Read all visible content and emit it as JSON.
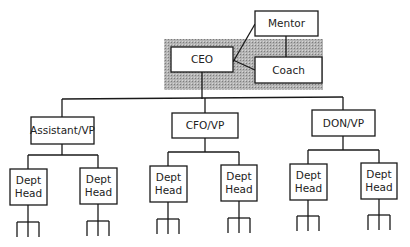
{
  "diagram": {
    "type": "org-chart",
    "colors": {
      "line": "#1a1a1a",
      "box_fill": "#ffffff",
      "shade": "#a8a8a8",
      "text": "#222222"
    },
    "shaded_region": {
      "x": 164,
      "y": 39,
      "w": 159,
      "h": 51
    },
    "nodes": [
      {
        "id": "mentor",
        "label": [
          "Mentor"
        ],
        "x": 255,
        "y": 11,
        "w": 63,
        "h": 25
      },
      {
        "id": "ceo",
        "label": [
          "CEO"
        ],
        "x": 171,
        "y": 47,
        "w": 62,
        "h": 25
      },
      {
        "id": "coach",
        "label": [
          "Coach"
        ],
        "x": 255,
        "y": 57,
        "w": 67,
        "h": 26
      },
      {
        "id": "assistant-vp",
        "label": [
          "Assistant/VP"
        ],
        "x": 31,
        "y": 117,
        "w": 63,
        "h": 27
      },
      {
        "id": "cfo-vp",
        "label": [
          "CFO/VP"
        ],
        "x": 172,
        "y": 113,
        "w": 66,
        "h": 25
      },
      {
        "id": "don-vp",
        "label": [
          "DON/VP"
        ],
        "x": 312,
        "y": 110,
        "w": 63,
        "h": 26
      },
      {
        "id": "dept-head-1",
        "label": [
          "Dept",
          "Head"
        ],
        "x": 10,
        "y": 169,
        "w": 37,
        "h": 36
      },
      {
        "id": "dept-head-2",
        "label": [
          "Dept",
          "Head"
        ],
        "x": 80,
        "y": 168,
        "w": 37,
        "h": 36
      },
      {
        "id": "dept-head-3",
        "label": [
          "Dept",
          "Head"
        ],
        "x": 150,
        "y": 166,
        "w": 37,
        "h": 36
      },
      {
        "id": "dept-head-4",
        "label": [
          "Dept",
          "Head"
        ],
        "x": 221,
        "y": 165,
        "w": 36,
        "h": 36
      },
      {
        "id": "dept-head-5",
        "label": [
          "Dept",
          "Head"
        ],
        "x": 290,
        "y": 164,
        "w": 37,
        "h": 36
      },
      {
        "id": "dept-head-6",
        "label": [
          "Dept",
          "Head"
        ],
        "x": 361,
        "y": 163,
        "w": 36,
        "h": 36
      }
    ],
    "edges": [
      {
        "from": "ceo",
        "to": "mentor",
        "points": [
          [
            233,
            62
          ],
          [
            255,
            24
          ]
        ]
      },
      {
        "from": "ceo",
        "to": "coach",
        "points": [
          [
            233,
            60
          ],
          [
            255,
            70
          ]
        ]
      },
      {
        "from": "mentor",
        "to": "coach",
        "points": [
          [
            286,
            36
          ],
          [
            286,
            57
          ]
        ]
      },
      {
        "from": "ceo",
        "to": "trunk",
        "points": [
          [
            202,
            72
          ],
          [
            202,
            99
          ]
        ]
      },
      {
        "from": "trunk",
        "to": "vps",
        "points": [
          [
            62,
            99
          ],
          [
            343,
            97
          ]
        ]
      },
      {
        "from": "trunk",
        "to": "assistant-vp",
        "points": [
          [
            62,
            99
          ],
          [
            62,
            117
          ]
        ]
      },
      {
        "from": "trunk",
        "to": "cfo-vp",
        "points": [
          [
            205,
            98
          ],
          [
            205,
            113
          ]
        ]
      },
      {
        "from": "trunk",
        "to": "don-vp",
        "points": [
          [
            343,
            97
          ],
          [
            343,
            110
          ]
        ]
      },
      {
        "from": "assistant-vp",
        "to": "bar1",
        "points": [
          [
            62,
            144
          ],
          [
            62,
            155
          ]
        ]
      },
      {
        "from": "bar1",
        "to": "dept-heads",
        "points": [
          [
            28,
            155
          ],
          [
            98,
            155
          ]
        ]
      },
      {
        "from": "bar1",
        "to": "dept-head-1",
        "points": [
          [
            28,
            155
          ],
          [
            28,
            169
          ]
        ]
      },
      {
        "from": "bar1",
        "to": "dept-head-2",
        "points": [
          [
            98,
            155
          ],
          [
            98,
            168
          ]
        ]
      },
      {
        "from": "cfo-vp",
        "to": "bar2",
        "points": [
          [
            205,
            138
          ],
          [
            205,
            152
          ]
        ]
      },
      {
        "from": "bar2",
        "to": "dept-heads",
        "points": [
          [
            168,
            152
          ],
          [
            239,
            152
          ]
        ]
      },
      {
        "from": "bar2",
        "to": "dept-head-3",
        "points": [
          [
            168,
            152
          ],
          [
            168,
            166
          ]
        ]
      },
      {
        "from": "bar2",
        "to": "dept-head-4",
        "points": [
          [
            239,
            152
          ],
          [
            239,
            165
          ]
        ]
      },
      {
        "from": "don-vp",
        "to": "bar3",
        "points": [
          [
            343,
            136
          ],
          [
            343,
            150
          ]
        ]
      },
      {
        "from": "bar3",
        "to": "dept-heads",
        "points": [
          [
            308,
            150
          ],
          [
            379,
            150
          ]
        ]
      },
      {
        "from": "bar3",
        "to": "dept-head-5",
        "points": [
          [
            308,
            150
          ],
          [
            308,
            164
          ]
        ]
      },
      {
        "from": "bar3",
        "to": "dept-head-6",
        "points": [
          [
            379,
            150
          ],
          [
            379,
            163
          ]
        ]
      }
    ],
    "forks": [
      {
        "parent": "dept-head-1",
        "cx": 28,
        "top": 205,
        "bar_y": 222,
        "bottom": 237,
        "half": 11
      },
      {
        "parent": "dept-head-2",
        "cx": 98,
        "top": 204,
        "bar_y": 221,
        "bottom": 236,
        "half": 11
      },
      {
        "parent": "dept-head-3",
        "cx": 168,
        "top": 202,
        "bar_y": 219,
        "bottom": 234,
        "half": 11
      },
      {
        "parent": "dept-head-4",
        "cx": 239,
        "top": 201,
        "bar_y": 218,
        "bottom": 233,
        "half": 11
      },
      {
        "parent": "dept-head-5",
        "cx": 308,
        "top": 200,
        "bar_y": 216,
        "bottom": 231,
        "half": 11
      },
      {
        "parent": "dept-head-6",
        "cx": 379,
        "top": 199,
        "bar_y": 215,
        "bottom": 230,
        "half": 11
      }
    ]
  }
}
